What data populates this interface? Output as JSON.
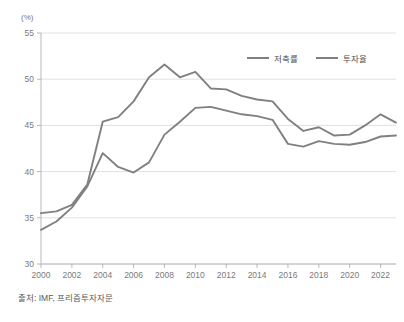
{
  "unit_label": "(%)",
  "source_note": "출처: IMF, 프리즘투자자문",
  "legend": {
    "position": "top-right",
    "items": [
      {
        "label": "저축률",
        "color": "#808080"
      },
      {
        "label": "투자율",
        "color": "#808080"
      }
    ]
  },
  "chart_data": {
    "type": "line",
    "title": "",
    "subtitle": "",
    "xlabel": "",
    "ylabel": "(%)",
    "ylim": [
      30,
      55
    ],
    "ytick_values": [
      30,
      35,
      40,
      45,
      50,
      55
    ],
    "ytick_labels": [
      "30",
      "35",
      "40",
      "45",
      "50",
      "55"
    ],
    "xlim": [
      2000,
      2023
    ],
    "xtick_values": [
      2000,
      2002,
      2004,
      2006,
      2008,
      2010,
      2012,
      2014,
      2016,
      2018,
      2020,
      2022
    ],
    "xtick_labels": [
      "2000",
      "2002",
      "2004",
      "2006",
      "2008",
      "2010",
      "2012",
      "2014",
      "2016",
      "2018",
      "2020",
      "2022"
    ],
    "grid": "horizontal",
    "legend_position": "top-right",
    "x": [
      2000,
      2001,
      2002,
      2003,
      2004,
      2005,
      2006,
      2007,
      2008,
      2009,
      2010,
      2011,
      2012,
      2013,
      2014,
      2015,
      2016,
      2017,
      2018,
      2019,
      2020,
      2021,
      2022,
      2023
    ],
    "series": [
      {
        "name": "저축률",
        "color": "#808080",
        "values": [
          35.5,
          35.7,
          36.4,
          38.6,
          45.4,
          45.9,
          47.6,
          50.2,
          51.6,
          50.2,
          50.8,
          49.0,
          48.9,
          48.2,
          47.8,
          47.6,
          45.7,
          44.4,
          44.8,
          43.9,
          44.0,
          45.0,
          46.2,
          45.3
        ]
      },
      {
        "name": "투자율",
        "color": "#808080",
        "values": [
          33.7,
          34.6,
          36.1,
          38.4,
          42.0,
          40.5,
          39.9,
          41.0,
          44.0,
          45.4,
          46.9,
          47.0,
          46.6,
          46.2,
          46.0,
          45.6,
          43.0,
          42.7,
          43.3,
          43.0,
          42.9,
          43.2,
          43.8,
          43.9
        ]
      }
    ]
  },
  "plot_geometry": {
    "left": 41,
    "right": 396,
    "top": 33,
    "bottom": 264
  }
}
